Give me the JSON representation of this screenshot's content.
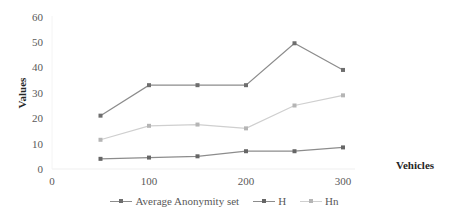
{
  "chart_data": {
    "type": "line",
    "title": "",
    "xlabel": "Vehicles",
    "ylabel": "Values",
    "x": [
      50,
      100,
      150,
      200,
      250,
      300
    ],
    "xlim": [
      0,
      350
    ],
    "ylim": [
      0,
      60
    ],
    "x_ticks": [
      0,
      100,
      200,
      300
    ],
    "y_ticks": [
      0,
      10,
      20,
      30,
      40,
      50,
      60
    ],
    "grid": false,
    "legend_position": "bottom",
    "series_identity_note": "Series names assigned by marker shade only; legend markers are not distinguishable by shape or color. Top and bottom lines are similar in darkness, so their labels may be swapped.",
    "series": [
      {
        "name": "Average Anonymity set",
        "values": [
          21,
          33,
          33,
          33,
          49.5,
          39
        ],
        "color": "#8c8c8c",
        "marker_color": "#6e6e6e"
      },
      {
        "name": "H",
        "values": [
          4,
          4.5,
          5,
          7,
          7,
          8.5
        ],
        "color": "#8c8c8c",
        "marker_color": "#666666"
      },
      {
        "name": "Hn",
        "values": [
          11.5,
          17,
          17.5,
          16,
          25,
          29
        ],
        "color": "#cfcfcf",
        "marker_color": "#b5b5b5"
      }
    ]
  },
  "legend": {
    "items": [
      {
        "label": "Average Anonymity set"
      },
      {
        "label": "H"
      },
      {
        "label": "Hn"
      }
    ]
  },
  "axes": {
    "x_title": "Vehicles",
    "y_title": "Values"
  }
}
